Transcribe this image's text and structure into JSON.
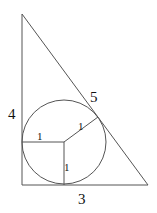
{
  "diagram": {
    "type": "right-triangle-with-incircle",
    "colors": {
      "background": "#ffffff",
      "line": "#555555",
      "text": "#111111"
    },
    "triangle": {
      "vertices": {
        "apex": [
          22,
          14
        ],
        "right_angle": [
          22,
          185
        ],
        "base_right": [
          148,
          185
        ]
      },
      "sides": {
        "vertical_leg": {
          "label": "4"
        },
        "horizontal_leg": {
          "label": "3"
        },
        "hypotenuse": {
          "label": "5"
        }
      }
    },
    "incircle": {
      "center": [
        64,
        142
      ],
      "radius_px": 42,
      "radii": [
        {
          "direction": "left",
          "label": "1"
        },
        {
          "direction": "to-hypotenuse",
          "label": "1"
        },
        {
          "direction": "down",
          "label": "1"
        }
      ]
    }
  }
}
